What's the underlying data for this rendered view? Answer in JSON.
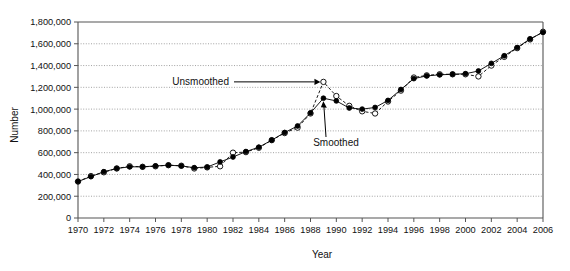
{
  "chart_data": {
    "type": "line",
    "title": "",
    "xlabel": "Year",
    "ylabel": "Number",
    "xlim": [
      1970,
      2006
    ],
    "ylim": [
      0,
      1800000
    ],
    "grid": true,
    "legend_position": "none",
    "xticks": [
      1970,
      1972,
      1974,
      1976,
      1978,
      1980,
      1982,
      1984,
      1986,
      1988,
      1990,
      1992,
      1994,
      1996,
      1998,
      2000,
      2002,
      2004,
      2006
    ],
    "xtick_labels": [
      "1970",
      "1972",
      "1974",
      "1976",
      "1978",
      "1980",
      "1982",
      "1984",
      "1986",
      "1988",
      "1990",
      "1992",
      "1994",
      "1996",
      "1998",
      "2000",
      "2002",
      "2004",
      "2006"
    ],
    "yticks": [
      0,
      200000,
      400000,
      600000,
      800000,
      1000000,
      1200000,
      1400000,
      1600000,
      1800000
    ],
    "ytick_labels": [
      "0",
      "200,000",
      "400,000",
      "600,000",
      "800,000",
      "1,000,000",
      "1,200,000",
      "1,400,000",
      "1,600,000",
      "1,800,000"
    ],
    "x": [
      1970,
      1971,
      1972,
      1973,
      1974,
      1975,
      1976,
      1977,
      1978,
      1979,
      1980,
      1981,
      1982,
      1983,
      1984,
      1985,
      1986,
      1987,
      1988,
      1989,
      1990,
      1991,
      1992,
      1993,
      1994,
      1995,
      1996,
      1997,
      1998,
      1999,
      2000,
      2001,
      2002,
      2003,
      2004,
      2005,
      2006
    ],
    "series": [
      {
        "name": "Unsmoothed",
        "marker": "open-circle",
        "line_style": "dashed",
        "values": [
          335000,
          385000,
          420000,
          455000,
          475000,
          470000,
          475000,
          485000,
          480000,
          455000,
          465000,
          475000,
          600000,
          605000,
          645000,
          715000,
          780000,
          830000,
          960000,
          1250000,
          1120000,
          1030000,
          980000,
          960000,
          1070000,
          1170000,
          1290000,
          1310000,
          1320000,
          1320000,
          1320000,
          1300000,
          1400000,
          1480000,
          1560000,
          1640000,
          1710000
        ]
      },
      {
        "name": "Smoothed",
        "marker": "filled-circle",
        "line_style": "solid",
        "values": [
          335000,
          380000,
          425000,
          455000,
          470000,
          470000,
          478000,
          485000,
          478000,
          462000,
          468000,
          515000,
          560000,
          610000,
          650000,
          715000,
          785000,
          845000,
          965000,
          1100000,
          1075000,
          1010000,
          1000000,
          1015000,
          1080000,
          1180000,
          1280000,
          1305000,
          1315000,
          1320000,
          1325000,
          1350000,
          1420000,
          1490000,
          1565000,
          1645000,
          1705000
        ]
      }
    ],
    "annotations": [
      {
        "text": "Unsmoothed",
        "target_x": 1989,
        "target_y": 1250000,
        "arrow": "right"
      },
      {
        "text": "Smoothed",
        "target_x": 1989,
        "target_y": 1100000,
        "arrow": "up-left"
      }
    ]
  }
}
